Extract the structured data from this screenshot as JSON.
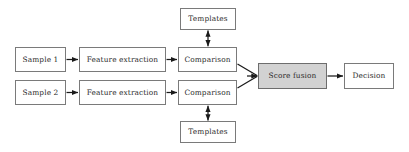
{
  "diagram": {
    "background_color": "#ffffff",
    "line_color": "#1a1a1a",
    "box_border_color": "#7a7a7a",
    "shaded_fill_color": "#d2d2d2",
    "text_color": "#2b2b2b",
    "nodes": [
      {
        "id": "sample1",
        "label": "Sample 1",
        "x": 15,
        "y": 47,
        "w": 51,
        "h": 25,
        "shaded": false
      },
      {
        "id": "sample2",
        "label": "Sample 2",
        "x": 15,
        "y": 80,
        "w": 51,
        "h": 25,
        "shaded": false
      },
      {
        "id": "feature1",
        "label": "Feature extraction",
        "x": 79,
        "y": 47,
        "w": 87,
        "h": 25,
        "shaded": false
      },
      {
        "id": "feature2",
        "label": "Feature extraction",
        "x": 79,
        "y": 80,
        "w": 87,
        "h": 25,
        "shaded": false
      },
      {
        "id": "comparison1",
        "label": "Comparison",
        "x": 178,
        "y": 47,
        "w": 59,
        "h": 25,
        "shaded": false
      },
      {
        "id": "comparison2",
        "label": "Comparison",
        "x": 178,
        "y": 80,
        "w": 59,
        "h": 25,
        "shaded": false
      },
      {
        "id": "templates-top",
        "label": "Templates",
        "x": 180,
        "y": 8,
        "w": 56,
        "h": 22,
        "shaded": false
      },
      {
        "id": "templates-bottom",
        "label": "Templates",
        "x": 180,
        "y": 121,
        "w": 56,
        "h": 22,
        "shaded": false
      },
      {
        "id": "score-fusion",
        "label": "Score fusion",
        "x": 258,
        "y": 63,
        "w": 69,
        "h": 26,
        "shaded": true
      },
      {
        "id": "decision",
        "label": "Decision",
        "x": 344,
        "y": 63,
        "w": 50,
        "h": 26,
        "shaded": false
      }
    ],
    "connectors": [
      {
        "id": "sample1-to-feature1",
        "type": "arrow-right"
      },
      {
        "id": "sample2-to-feature2",
        "type": "arrow-right"
      },
      {
        "id": "feature1-to-comparison1",
        "type": "arrow-right"
      },
      {
        "id": "feature2-to-comparison2",
        "type": "arrow-right"
      },
      {
        "id": "templates-top-to-comparison1",
        "type": "arrow-double-vertical"
      },
      {
        "id": "templates-bottom-to-comparison2",
        "type": "arrow-double-vertical"
      },
      {
        "id": "comparison1-to-score-fusion",
        "type": "arrow-diagonal-down"
      },
      {
        "id": "comparison2-to-score-fusion",
        "type": "arrow-diagonal-up"
      },
      {
        "id": "score-fusion-to-decision",
        "type": "arrow-right"
      }
    ]
  }
}
